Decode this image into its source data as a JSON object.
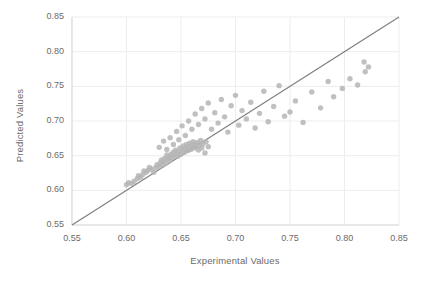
{
  "chart_data": {
    "type": "scatter",
    "title": "",
    "xlabel": "Experimental Values",
    "ylabel": "Predicted Values",
    "xlim": [
      0.55,
      0.85
    ],
    "ylim": [
      0.55,
      0.85
    ],
    "xticks": [
      "0.55",
      "0.60",
      "0.65",
      "0.70",
      "0.75",
      "0.80",
      "0.85"
    ],
    "yticks": [
      "0.85",
      "0.80",
      "0.75",
      "0.70",
      "0.65",
      "0.60",
      "0.55"
    ],
    "xtick_values": [
      0.55,
      0.6,
      0.65,
      0.7,
      0.75,
      0.8,
      0.85
    ],
    "ytick_values": [
      0.85,
      0.8,
      0.75,
      0.7,
      0.65,
      0.6,
      0.55
    ],
    "grid": true,
    "legend": "none",
    "marker_color": "#b5b5b5",
    "line_color": "#7f7f7f",
    "grid_color": "#ededed",
    "axis_color": "#d9d9d9",
    "text_color": "#6b6b6b",
    "reference_line": {
      "name": "identity-line",
      "x": [
        0.55,
        0.85
      ],
      "y": [
        0.55,
        0.85
      ]
    },
    "points": [
      [
        0.6,
        0.608
      ],
      [
        0.602,
        0.611
      ],
      [
        0.605,
        0.61
      ],
      [
        0.607,
        0.613
      ],
      [
        0.61,
        0.617
      ],
      [
        0.611,
        0.621
      ],
      [
        0.613,
        0.619
      ],
      [
        0.615,
        0.623
      ],
      [
        0.616,
        0.628
      ],
      [
        0.618,
        0.626
      ],
      [
        0.62,
        0.629
      ],
      [
        0.621,
        0.633
      ],
      [
        0.623,
        0.631
      ],
      [
        0.625,
        0.626
      ],
      [
        0.627,
        0.633
      ],
      [
        0.628,
        0.637
      ],
      [
        0.63,
        0.634
      ],
      [
        0.631,
        0.64
      ],
      [
        0.632,
        0.644
      ],
      [
        0.633,
        0.637
      ],
      [
        0.634,
        0.642
      ],
      [
        0.635,
        0.646
      ],
      [
        0.636,
        0.639
      ],
      [
        0.637,
        0.651
      ],
      [
        0.638,
        0.645
      ],
      [
        0.639,
        0.648
      ],
      [
        0.64,
        0.643
      ],
      [
        0.641,
        0.652
      ],
      [
        0.642,
        0.647
      ],
      [
        0.643,
        0.655
      ],
      [
        0.644,
        0.65
      ],
      [
        0.645,
        0.658
      ],
      [
        0.646,
        0.653
      ],
      [
        0.647,
        0.649
      ],
      [
        0.648,
        0.656
      ],
      [
        0.649,
        0.661
      ],
      [
        0.65,
        0.652
      ],
      [
        0.651,
        0.658
      ],
      [
        0.652,
        0.664
      ],
      [
        0.653,
        0.655
      ],
      [
        0.654,
        0.66
      ],
      [
        0.655,
        0.666
      ],
      [
        0.656,
        0.657
      ],
      [
        0.657,
        0.662
      ],
      [
        0.658,
        0.668
      ],
      [
        0.659,
        0.659
      ],
      [
        0.66,
        0.665
      ],
      [
        0.661,
        0.67
      ],
      [
        0.662,
        0.661
      ],
      [
        0.663,
        0.667
      ],
      [
        0.664,
        0.663
      ],
      [
        0.665,
        0.669
      ],
      [
        0.666,
        0.658
      ],
      [
        0.667,
        0.665
      ],
      [
        0.668,
        0.672
      ],
      [
        0.669,
        0.661
      ],
      [
        0.67,
        0.667
      ],
      [
        0.672,
        0.654
      ],
      [
        0.673,
        0.67
      ],
      [
        0.675,
        0.663
      ],
      [
        0.63,
        0.662
      ],
      [
        0.634,
        0.671
      ],
      [
        0.637,
        0.659
      ],
      [
        0.64,
        0.676
      ],
      [
        0.643,
        0.666
      ],
      [
        0.646,
        0.685
      ],
      [
        0.648,
        0.673
      ],
      [
        0.651,
        0.693
      ],
      [
        0.654,
        0.679
      ],
      [
        0.657,
        0.7
      ],
      [
        0.66,
        0.688
      ],
      [
        0.663,
        0.71
      ],
      [
        0.666,
        0.695
      ],
      [
        0.669,
        0.718
      ],
      [
        0.672,
        0.703
      ],
      [
        0.675,
        0.726
      ],
      [
        0.678,
        0.688
      ],
      [
        0.681,
        0.712
      ],
      [
        0.684,
        0.697
      ],
      [
        0.687,
        0.731
      ],
      [
        0.69,
        0.706
      ],
      [
        0.693,
        0.684
      ],
      [
        0.696,
        0.722
      ],
      [
        0.7,
        0.737
      ],
      [
        0.703,
        0.694
      ],
      [
        0.706,
        0.715
      ],
      [
        0.71,
        0.703
      ],
      [
        0.714,
        0.727
      ],
      [
        0.718,
        0.69
      ],
      [
        0.722,
        0.711
      ],
      [
        0.726,
        0.743
      ],
      [
        0.73,
        0.699
      ],
      [
        0.735,
        0.721
      ],
      [
        0.74,
        0.751
      ],
      [
        0.745,
        0.707
      ],
      [
        0.75,
        0.713
      ],
      [
        0.755,
        0.729
      ],
      [
        0.762,
        0.698
      ],
      [
        0.77,
        0.742
      ],
      [
        0.778,
        0.719
      ],
      [
        0.785,
        0.757
      ],
      [
        0.79,
        0.735
      ],
      [
        0.798,
        0.747
      ],
      [
        0.805,
        0.761
      ],
      [
        0.812,
        0.752
      ],
      [
        0.818,
        0.785
      ],
      [
        0.819,
        0.771
      ],
      [
        0.822,
        0.778
      ]
    ]
  }
}
